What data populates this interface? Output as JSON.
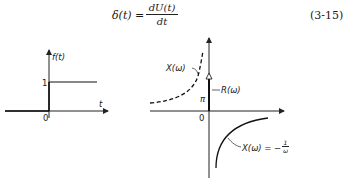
{
  "equation": {
    "lhs": "δ(t) =",
    "numerator": "dU(t)",
    "denominator": "dt",
    "number": "(3-15)"
  },
  "left_plot": {
    "ylabel": "f(t)",
    "xlabel": "t",
    "origin": "0",
    "step_level": "1"
  },
  "right_plot": {
    "origin": "0",
    "pi_label": "π",
    "dashed_label": "X(ω)",
    "impulse_label": "R(ω)",
    "solid_label": "X(ω) = −",
    "solid_frac_num": "1",
    "solid_frac_den": "ω"
  }
}
